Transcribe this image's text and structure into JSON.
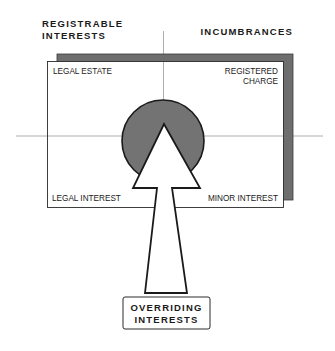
{
  "diagram": {
    "headers": {
      "left_line1": "REGISTRABLE",
      "left_line2": "INTERESTS",
      "right": "INCUMBRANCES"
    },
    "quadrants": {
      "top_left": "LEGAL ESTATE",
      "top_right_line1": "REGISTERED",
      "top_right_line2": "CHARGE",
      "bottom_left": "LEGAL INTEREST",
      "bottom_right": "MINOR INTEREST"
    },
    "source_box": {
      "line1": "OVERRIDING",
      "line2": "INTERESTS"
    },
    "colors": {
      "shadow": "#6e6e6e",
      "circle_fill": "#737373",
      "stroke": "#1a1a1a",
      "axis_line": "#9a9a9a"
    }
  }
}
